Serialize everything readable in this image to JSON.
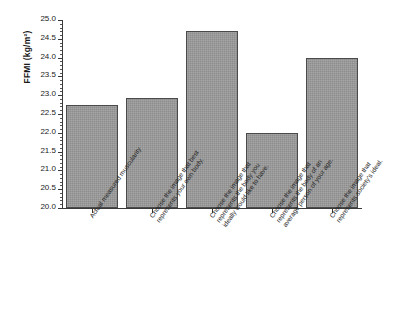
{
  "chart_data": {
    "type": "bar",
    "title": "",
    "xlabel": "",
    "ylabel": "FFMI (kg/m²)",
    "ylim": [
      20.0,
      25.0
    ],
    "ytick_labels": [
      "25.0",
      "24.5",
      "24.0",
      "23.5",
      "23.0",
      "22.5",
      "22.0",
      "21.5",
      "21.0",
      "20.5",
      "20.0"
    ],
    "ytick_values": [
      25.0,
      24.5,
      24.0,
      23.5,
      23.0,
      22.5,
      22.0,
      21.5,
      21.0,
      20.5,
      20.0
    ],
    "grid": false,
    "legend": "none",
    "bar_color": "#8d8d8d",
    "bar_edge_color": "#4a4a4a",
    "categories": [
      "Actual measured muscularity",
      "Choose the image that best represents your own body.",
      "Choose the image that represents the body you ideally would like to have.",
      "Choose the image that represents the body of an average person of your age.",
      "Choose the image that represents society's ideal."
    ],
    "values": [
      22.75,
      22.92,
      24.7,
      22.0,
      24.0
    ]
  }
}
